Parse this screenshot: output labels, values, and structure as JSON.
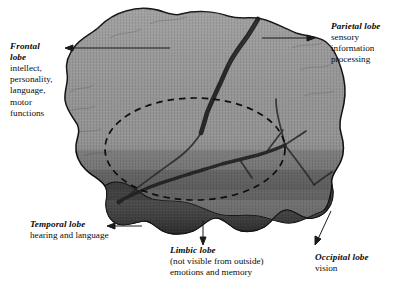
{
  "figure": {
    "background_color": "#ffffff",
    "width": 410,
    "height": 294
  },
  "colors": {
    "cortex_light": "#969696",
    "cortex_mid": "#8a8a8a",
    "temporal_dark": "#2b2b2b",
    "outline": "#111111",
    "sulcus": "#1d1d1d",
    "text": "#0b0b0b",
    "arrow": "#1a1a1a",
    "dashed_ellipse": "#0d0d0d"
  },
  "labels": {
    "frontal": {
      "name_line1": "Frontal",
      "name_line2": "lobe",
      "desc": [
        "intellect,",
        "personality,",
        "language,",
        "motor",
        "functions"
      ]
    },
    "parietal": {
      "name_line1": "Parietal lobe",
      "desc": [
        "sensory",
        "information",
        "processing"
      ]
    },
    "temporal": {
      "name_line1": "Temporal lobe",
      "desc": [
        "hearing and language"
      ]
    },
    "limbic": {
      "name_line1": "Limbic lobe",
      "desc": [
        "(not visible from outside)",
        "emotions and  memory"
      ]
    },
    "occipital": {
      "name_line1": "Occipital lobe",
      "desc": [
        "vision"
      ]
    }
  },
  "annotations": {
    "arrows": [
      {
        "name": "frontal-arrow",
        "from": [
          170,
          48
        ],
        "to": [
          66,
          48
        ],
        "direction": "left"
      },
      {
        "name": "parietal-arrow",
        "from": [
          262,
          38
        ],
        "to": [
          314,
          38
        ],
        "direction": "right"
      },
      {
        "name": "temporal-arrow",
        "from": [
          142,
          226
        ],
        "to": [
          108,
          226
        ],
        "direction": "left"
      },
      {
        "name": "limbic-arrow",
        "from": [
          203,
          221
        ],
        "to": [
          203,
          243
        ],
        "direction": "down"
      },
      {
        "name": "occipital-arrow",
        "from": [
          330,
          212
        ],
        "to": [
          316,
          243
        ],
        "direction": "down-left"
      }
    ],
    "limbic_ellipse": {
      "center": [
        195,
        149
      ],
      "radius_x": 90,
      "radius_y": 51,
      "style": "dashed"
    }
  }
}
